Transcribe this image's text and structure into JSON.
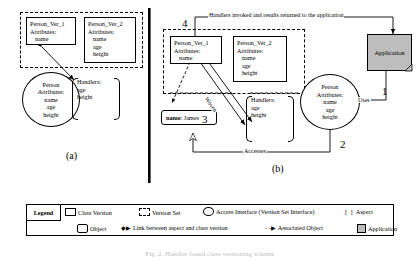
{
  "figure": {
    "caption": "Fig. 2. Handler based class versioning scheme",
    "panel_a_label": "(a)",
    "panel_b_label": "(b)"
  },
  "panel_a": {
    "version_set": {
      "name": "version-set-a",
      "class_versions": [
        {
          "title": "Person_Ver_1",
          "attributes_label": "Attributes:",
          "values": [
            "name"
          ]
        },
        {
          "title": "Person_Ver_2",
          "attributes_label": "Attributes:",
          "values": [
            "name",
            "age",
            "height"
          ]
        }
      ]
    },
    "access_interface": {
      "title": "Person",
      "attributes_label": "Attributes:",
      "values": [
        "name",
        "age",
        "height"
      ]
    },
    "aspect": {
      "title": "Handlers:",
      "values": [
        "age",
        "height"
      ]
    }
  },
  "panel_b": {
    "version_set": {
      "class_versions": [
        {
          "title": "Person_Ver_1",
          "attributes_label": "Attributes:",
          "values": [
            "name"
          ]
        },
        {
          "title": "Person_Ver_2",
          "attributes_label": "Attributes:",
          "values": [
            "name",
            "age",
            "height"
          ]
        }
      ]
    },
    "access_interface": {
      "title": "Person",
      "attributes_label": "Attributes:",
      "values": [
        "name",
        "age",
        "height"
      ]
    },
    "aspect": {
      "title": "Handlers:",
      "values": [
        "age",
        "height"
      ]
    },
    "object": {
      "attribute": "name",
      "separator": ":",
      "value": "James"
    },
    "application": {
      "label": "Application"
    },
    "steps": {
      "one": "1",
      "two": "2",
      "three": "3",
      "four": "4"
    },
    "edge_labels": {
      "uses": "Uses",
      "accesses": "Accesses",
      "woven": "Woven",
      "handlers_returned": "Handlers invoked and results returned to the application"
    }
  },
  "legend": {
    "title": "Legend",
    "row1": [
      {
        "icon": "class-version-icon",
        "label": "Class Version"
      },
      {
        "icon": "version-set-icon",
        "label": "Version Set"
      },
      {
        "icon": "access-interface-icon",
        "label": "Access Interface (Version Set Interface)"
      },
      {
        "icon": "aspect-icon",
        "glyph": "[  ]",
        "label": "Aspect"
      }
    ],
    "row2": [
      {
        "icon": "object-icon",
        "label": "Object"
      },
      {
        "icon": "link-arrow-icon",
        "glyph": "◆▶",
        "label": "Link between aspect and class version"
      },
      {
        "icon": "associated-object-icon",
        "glyph": "- -▶",
        "label": "Associated Object"
      },
      {
        "icon": "application-icon",
        "label": "Application"
      }
    ]
  }
}
